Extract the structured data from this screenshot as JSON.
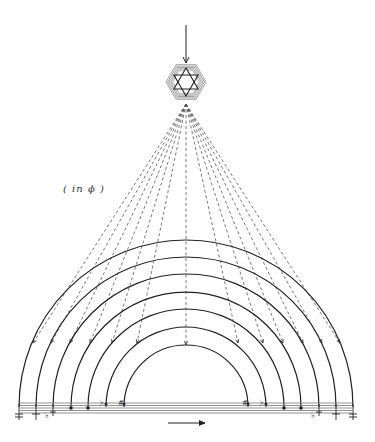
{
  "diagram": {
    "label": "( in ϕ )",
    "colors": {
      "ink": "#222222",
      "dash": "#555555",
      "staff": "#777777"
    },
    "source_arrow": {
      "x": 186,
      "y1": 25,
      "y2": 63,
      "direction": "down"
    },
    "hexagram": {
      "cx": 186,
      "cy": 82,
      "r": 20
    },
    "fan_origin": {
      "x": 186,
      "y": 104
    },
    "arcs": {
      "center_x": 186,
      "baseline_y": 407,
      "radii": [
        167,
        150,
        133,
        115,
        98,
        80,
        62
      ]
    },
    "dashed_targets": [
      {
        "x": 33,
        "y": 343
      },
      {
        "x": 51,
        "y": 343
      },
      {
        "x": 70,
        "y": 343
      },
      {
        "x": 90,
        "y": 343
      },
      {
        "x": 112,
        "y": 343
      },
      {
        "x": 137,
        "y": 343
      },
      {
        "x": 186,
        "y": 345
      },
      {
        "x": 238,
        "y": 343
      },
      {
        "x": 263,
        "y": 343
      },
      {
        "x": 283,
        "y": 343
      },
      {
        "x": 303,
        "y": 343
      },
      {
        "x": 322,
        "y": 343
      },
      {
        "x": 340,
        "y": 343
      }
    ],
    "staff": {
      "x1": 20,
      "x2": 352,
      "y_lines": [
        403,
        405.5,
        408,
        410.5,
        413
      ]
    },
    "direction_arrow": {
      "x1": 168,
      "x2": 205,
      "y": 423,
      "direction": "right"
    },
    "note_marks_left": [
      "double-sharp",
      "sharp-down",
      "flat-sharp",
      "note",
      "note",
      "flat",
      "sharp"
    ],
    "note_marks_right": [
      "sharp",
      "flat",
      "note",
      "note",
      "flat-sharp",
      "sharp-down",
      "double-sharp"
    ]
  }
}
